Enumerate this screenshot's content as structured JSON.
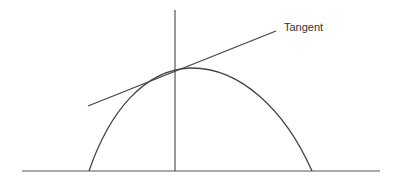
{
  "diagram": {
    "labels": {
      "tangent": "Tangent"
    },
    "colors": {
      "stroke": "#444444",
      "text": "#333333"
    },
    "geometry": {
      "x_axis": {
        "x1": 22,
        "y1": 171,
        "x2": 380,
        "y2": 171
      },
      "y_axis": {
        "x1": 175,
        "y1": 10,
        "x2": 175,
        "y2": 171
      },
      "parabola": {
        "left_foot": [
          89,
          171
        ],
        "apex": [
          190,
          67
        ],
        "right_foot": [
          312,
          171
        ]
      },
      "tangent_line": {
        "x1": 88,
        "y1": 106,
        "x2": 276,
        "y2": 31
      },
      "tangent_point": [
        175,
        72
      ]
    }
  }
}
